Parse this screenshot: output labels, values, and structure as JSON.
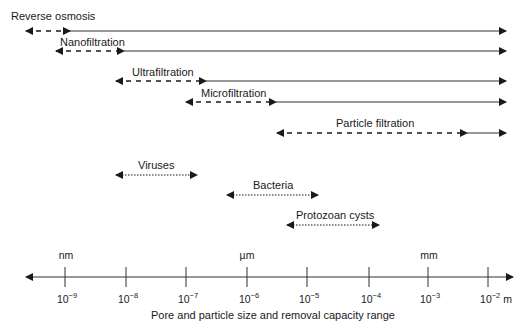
{
  "title": "Pore and particle size and removal capacity range",
  "axis": {
    "label": "Pore and particle size and removal capacity range",
    "ticks": [
      {
        "base": "10",
        "exp": "−9",
        "x": 65
      },
      {
        "base": "10",
        "exp": "−8",
        "x": 126
      },
      {
        "base": "10",
        "exp": "−7",
        "x": 186
      },
      {
        "base": "10",
        "exp": "−6",
        "x": 247
      },
      {
        "base": "10",
        "exp": "−5",
        "x": 307
      },
      {
        "base": "10",
        "exp": "−4",
        "x": 369
      },
      {
        "base": "10",
        "exp": "−3",
        "x": 428
      },
      {
        "base": "10",
        "exp": "−2",
        "x": 488
      }
    ],
    "unit_suffix": "m",
    "unit_markers": [
      {
        "label": "nm",
        "x": 65
      },
      {
        "label": "µm",
        "x": 247
      },
      {
        "label": "mm",
        "x": 428
      }
    ]
  },
  "processes": [
    {
      "label": "Reverse osmosis",
      "range_start": "10^-10",
      "range_dashed_end": "10^-9",
      "solid_end": "10^-2"
    },
    {
      "label": "Nanofiltration",
      "range_start": "10^-9",
      "range_dashed_end": "10^-8",
      "solid_end": "10^-2"
    },
    {
      "label": "Ultrafiltration",
      "range_start": "10^-8",
      "range_dashed_end": "10^-7",
      "solid_end": "10^-2"
    },
    {
      "label": "Microfiltration",
      "range_start": "10^-7",
      "range_dashed_end": "10^-6",
      "solid_end": "10^-2"
    },
    {
      "label": "Particle filtration",
      "range_start": "10^-6",
      "range_dashed_end": "10^-2.5",
      "solid_end": "10^-2"
    }
  ],
  "particles": [
    {
      "label": "Viruses",
      "range": [
        "10^-8",
        "10^-7"
      ]
    },
    {
      "label": "Bacteria",
      "range": [
        "10^-6.3",
        "10^-5"
      ]
    },
    {
      "label": "Protozoan cysts",
      "range": [
        "10^-5.3",
        "10^-4"
      ]
    }
  ]
}
